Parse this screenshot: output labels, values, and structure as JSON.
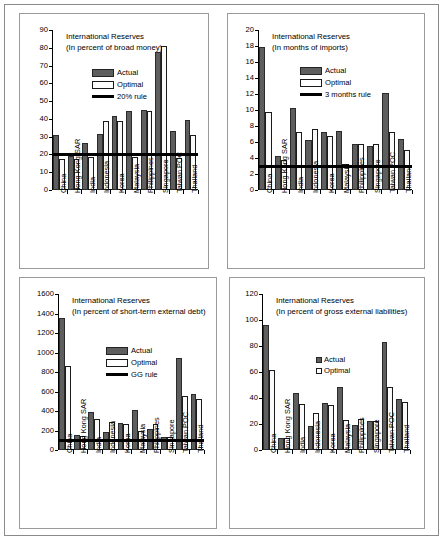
{
  "figure": {
    "categories": [
      "China",
      "Hong Kong SAR",
      "India",
      "Indonesia",
      "Korea",
      "Malaysia",
      "Philippines",
      "Singapore",
      "Taiwan POC",
      "Thailand"
    ],
    "series_labels": {
      "actual": "Actual",
      "optimal": "Optimal"
    },
    "colors": {
      "actual": "#5e5e5e",
      "optimal": "#fafafa",
      "rule": "#000000",
      "axis": "#000000",
      "frame": "#9a9a9a"
    }
  },
  "chart_data": [
    {
      "id": "broad-money",
      "type": "bar",
      "title": "International Reserves",
      "subtitle": "(In percent of broad money)",
      "xlabel": "",
      "ylabel": "",
      "ylim": [
        0,
        90
      ],
      "yticks": [
        0,
        10,
        20,
        30,
        40,
        50,
        60,
        70,
        80,
        90
      ],
      "grid": false,
      "legend_position": "upper-left-inside",
      "categories": [
        "China",
        "Hong Kong SAR",
        "India",
        "Indonesia",
        "Korea",
        "Malaysia",
        "Philippines",
        "Singapore",
        "Taiwan POC",
        "Thailand"
      ],
      "series": [
        {
          "name": "Actual",
          "values": [
            31.0,
            19.2,
            26.2,
            31.7,
            41.7,
            44.3,
            45.0,
            77.7,
            33.0,
            39.5
          ]
        },
        {
          "name": "Optimal",
          "values": [
            17.2,
            17.2,
            18.6,
            39.0,
            39.0,
            18.7,
            44.2,
            80.8,
            17.9,
            30.8
          ]
        }
      ],
      "reference_line": {
        "label": "20% rule",
        "value": 20
      }
    },
    {
      "id": "months-imports",
      "type": "bar",
      "title": "International Reserves",
      "subtitle": "(In months of imports)",
      "xlabel": "",
      "ylabel": "",
      "ylim": [
        0,
        20
      ],
      "yticks": [
        0,
        2,
        4,
        6,
        8,
        10,
        12,
        14,
        16,
        18,
        20
      ],
      "grid": false,
      "legend_position": "upper-left-inside",
      "categories": [
        "China",
        "Hong Kong SAR",
        "India",
        "Indonesia",
        "Korea",
        "Malaysia",
        "Philippines",
        "Singapore",
        "Taiwan POC",
        "Thailand"
      ],
      "series": [
        {
          "name": "Actual",
          "values": [
            17.9,
            4.3,
            10.3,
            6.2,
            7.2,
            7.4,
            5.8,
            5.5,
            12.1,
            6.4
          ]
        },
        {
          "name": "Optimal",
          "values": [
            9.8,
            3.8,
            7.3,
            7.6,
            6.7,
            3.2,
            5.7,
            5.8,
            7.3,
            5.0
          ]
        }
      ],
      "reference_line": {
        "label": "3 months rule",
        "value": 3
      }
    },
    {
      "id": "short-term-debt",
      "type": "bar",
      "title": "International Reserves",
      "subtitle": "(In percent of short-term external debt)",
      "xlabel": "",
      "ylabel": "",
      "ylim": [
        0,
        1600
      ],
      "yticks": [
        0,
        200,
        400,
        600,
        800,
        1000,
        1200,
        1400,
        1600
      ],
      "grid": false,
      "legend_position": "upper-center-inside",
      "categories": [
        "China",
        "Hong Kong SAR",
        "India",
        "Indonesia",
        "Korea",
        "Malaysia",
        "Philippines",
        "Singapore",
        "Taiwan POC",
        "Thailand"
      ],
      "series": [
        {
          "name": "Actual",
          "values": [
            1350,
            155,
            395,
            185,
            275,
            415,
            220,
            130,
            945,
            570
          ]
        },
        {
          "name": "Optimal",
          "values": [
            860,
            140,
            315,
            285,
            262,
            197,
            268,
            130,
            550,
            527
          ]
        }
      ],
      "reference_line": {
        "label": "GG rule",
        "value": 100
      }
    },
    {
      "id": "gross-external-liabilities",
      "type": "bar",
      "title": "International Reserves",
      "subtitle": "(In percent of gross external liabilities)",
      "xlabel": "",
      "ylabel": "",
      "ylim": [
        0,
        120
      ],
      "yticks": [
        0,
        20,
        40,
        60,
        80,
        100,
        120
      ],
      "grid": false,
      "legend_position": "center-inside",
      "categories": [
        "China",
        "Hong Kong SAR",
        "India",
        "Indonesia",
        "Korea",
        "Malaysia",
        "Philippines",
        "Singapore",
        "Taiwan POC",
        "Thailand"
      ],
      "series": [
        {
          "name": "Actual",
          "values": [
            96.5,
            9.5,
            44.2,
            18.8,
            36.2,
            48.8,
            19.3,
            22.5,
            82.8,
            39.5
          ]
        },
        {
          "name": "Optimal",
          "values": [
            61.5,
            9.2,
            35.2,
            28.7,
            34.7,
            23.0,
            24.2,
            22.2,
            48.5,
            36.8
          ]
        }
      ],
      "reference_line": null
    }
  ]
}
